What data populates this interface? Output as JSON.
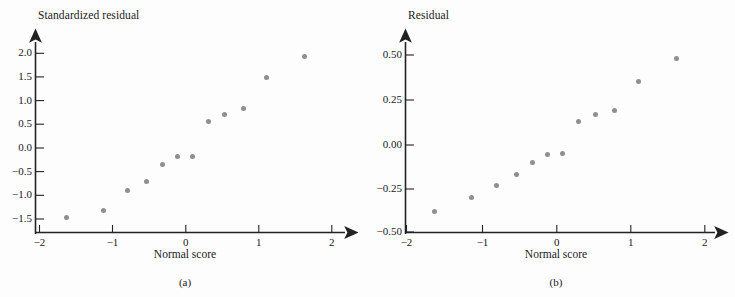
{
  "figure": {
    "background": "#fdfdfd",
    "dot_color": "#8e8e93",
    "axis_color": "#222222"
  },
  "chart_data": [
    {
      "type": "scatter",
      "title": "",
      "panel_label": "(a)",
      "xlabel": "Normal score",
      "ylabel": "Standardized residual",
      "xlim": [
        -2.2,
        2.25
      ],
      "ylim": [
        -1.72,
        2.25
      ],
      "xticks": [
        -2,
        -1,
        0,
        1,
        2
      ],
      "xticklabels": [
        "−2",
        "−1",
        "0",
        "1",
        "2"
      ],
      "yticks": [
        -1.5,
        -1.0,
        -0.5,
        0.0,
        0.5,
        1.0,
        1.5,
        2.0
      ],
      "yticklabels": [
        "−1.5",
        "−1.0",
        "−0.5",
        "0.0",
        "0.5",
        "1.0",
        "1.5",
        "2.0"
      ],
      "grid": false,
      "legend": "none",
      "x": [
        -1.63,
        -1.13,
        -0.79,
        -0.53,
        -0.31,
        -0.11,
        0.09,
        0.31,
        0.53,
        0.79,
        1.11,
        1.62
      ],
      "y": [
        -1.46,
        -1.32,
        -0.89,
        -0.71,
        -0.35,
        -0.17,
        -0.18,
        0.57,
        0.71,
        0.83,
        1.48,
        1.94
      ]
    },
    {
      "type": "scatter",
      "title": "",
      "panel_label": "(b)",
      "xlabel": "Normal score",
      "ylabel": "Residual",
      "xlim": [
        -2.2,
        2.25
      ],
      "ylim": [
        -0.575,
        0.6
      ],
      "xticks": [
        -2,
        -1,
        0,
        1,
        2
      ],
      "xticklabels": [
        "−2",
        "−1",
        "0",
        "1",
        "2"
      ],
      "yticks": [
        -0.5,
        -0.25,
        0.0,
        0.25,
        0.5
      ],
      "yticklabels": [
        "−0.50",
        "−0.25",
        "0.00",
        "0.25",
        "0.50"
      ],
      "grid": false,
      "legend": "none",
      "x": [
        -1.63,
        -1.13,
        -0.79,
        -0.53,
        -0.31,
        -0.11,
        0.09,
        0.31,
        0.53,
        0.79,
        1.11,
        1.62
      ],
      "y": [
        -0.385,
        -0.305,
        -0.238,
        -0.175,
        -0.105,
        -0.063,
        -0.056,
        0.125,
        0.166,
        0.187,
        0.349,
        0.478
      ]
    }
  ]
}
